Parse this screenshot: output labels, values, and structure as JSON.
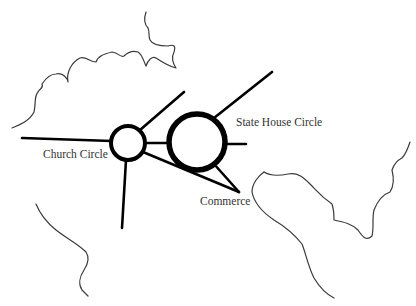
{
  "diagram": {
    "type": "street-map-sketch",
    "labels": {
      "church_circle": "Church Circle",
      "state_house_circle": "State House Circle",
      "commerce": "Commerce"
    },
    "nodes": [
      {
        "id": "church_circle",
        "label": "Church Circle",
        "shape": "circle"
      },
      {
        "id": "state_house_circle",
        "label": "State House Circle",
        "shape": "circle"
      },
      {
        "id": "commerce",
        "label": "Commerce",
        "shape": "junction"
      }
    ],
    "edges": [
      {
        "from": "church_circle",
        "to": "state_house_circle"
      },
      {
        "from": "church_circle",
        "to": "commerce"
      },
      {
        "from": "state_house_circle",
        "to": "commerce"
      }
    ],
    "colors": {
      "road": "#000000",
      "coastline": "#3a3a3a",
      "label": "#333333",
      "background": "#ffffff"
    }
  }
}
